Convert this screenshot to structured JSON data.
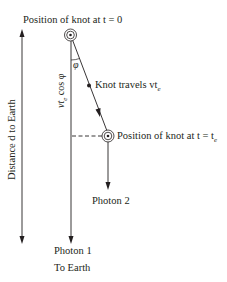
{
  "diagram": {
    "colors": {
      "ink": "#231f20",
      "background": "#ffffff"
    },
    "labels": {
      "knot_start": "Position of knot at t = 0",
      "knot_travels": "Knot travels vt",
      "knot_travels_sub": "e",
      "knot_end": "Position of knot at t = t",
      "knot_end_sub": "e",
      "photon2": "Photon 2",
      "photon1": "Photon 1",
      "to_earth": "To Earth",
      "distance": "Distance d to Earth",
      "vertical_component": "vt",
      "vertical_component_sub": "e",
      "vertical_component_rest": " cos φ",
      "angle": "φ"
    },
    "nodes": [
      {
        "id": "knot-t0",
        "x": 70,
        "y": 35,
        "label_ref": "knot_start"
      },
      {
        "id": "knot-moving",
        "x": 89,
        "y": 85,
        "label_ref": "knot_travels"
      },
      {
        "id": "knot-te",
        "x": 108,
        "y": 136,
        "label_ref": "knot_end"
      }
    ],
    "edges": [
      {
        "from": "knot-t0",
        "to": "knot-te",
        "type": "arrow",
        "meaning": "knot path"
      },
      {
        "from": "knot-t0",
        "to": "photon1-end",
        "type": "arrow",
        "meaning": "photon 1 to earth"
      },
      {
        "from": "knot-te",
        "to": "photon2-end",
        "type": "arrow",
        "meaning": "photon 2"
      },
      {
        "from": "knot-te",
        "to": "photon1-line",
        "type": "dashed",
        "meaning": "projection"
      },
      {
        "from": "distance-bottom",
        "to": "distance-top",
        "type": "double-arrow",
        "meaning": "distance d"
      }
    ]
  }
}
